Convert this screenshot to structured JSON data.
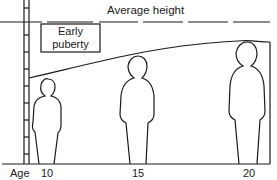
{
  "diagram": {
    "title_line": "Average height",
    "box_label_line1": "Early",
    "box_label_line2": "puberty",
    "axis": {
      "label": "Age",
      "ticks": [
        "10",
        "15",
        "20"
      ]
    },
    "figures": [
      {
        "age": "10",
        "description": "short child figure"
      },
      {
        "age": "15",
        "description": "medium adolescent figure"
      },
      {
        "age": "20",
        "description": "tall adult figure"
      }
    ],
    "elements": {
      "ruler": "vertical measuring ladder on left",
      "average_line": "dashed horizontal line",
      "growth_curve": "curve rising from age 10 to age 20"
    },
    "colors": {
      "line": "#1a1a1a",
      "background": "#ffffff"
    }
  }
}
